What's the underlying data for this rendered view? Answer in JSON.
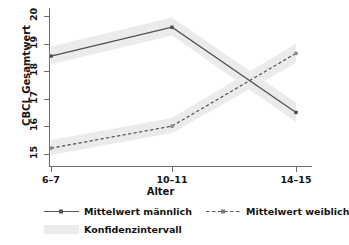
{
  "chart_data": {
    "type": "line",
    "title": "",
    "xlabel": "Alter",
    "ylabel": "CBCL Gesamtwert",
    "categories": [
      "6–7",
      "10–11",
      "14–15"
    ],
    "x_tick_labels": [
      "6–7",
      "10–11",
      "14–15"
    ],
    "y_tick_labels": [
      "15",
      "16",
      "17",
      "18",
      "19",
      "20"
    ],
    "ylim": [
      14.55,
      20.3
    ],
    "yticks": [
      15,
      16,
      17,
      18,
      19,
      20
    ],
    "grid": false,
    "legend_position": "bottom",
    "series": [
      {
        "name": "Mittelwert männlich",
        "style": "solid",
        "marker": "square",
        "color": "#4d4d4d",
        "values": [
          18.55,
          19.6,
          16.5
        ],
        "ci_lower": [
          18.25,
          19.3,
          16.15
        ],
        "ci_upper": [
          18.9,
          19.95,
          16.85
        ]
      },
      {
        "name": "Mittelwert weiblich",
        "style": "dashed",
        "marker": "square",
        "color": "#4d4d4d",
        "values": [
          15.2,
          16.0,
          18.65
        ],
        "ci_lower": [
          14.95,
          15.75,
          18.3
        ],
        "ci_upper": [
          15.5,
          16.3,
          19.0
        ]
      }
    ],
    "confidence_band_color": "#eceaea"
  },
  "axes": {
    "y_title": "CBCL Gesamtwert",
    "x_title": "Alter",
    "y_ticks": [
      {
        "label": "20",
        "value": 20
      },
      {
        "label": "19",
        "value": 19
      },
      {
        "label": "18",
        "value": 18
      },
      {
        "label": "17",
        "value": 17
      },
      {
        "label": "16",
        "value": 16
      },
      {
        "label": "15",
        "value": 15
      }
    ],
    "x_ticks": [
      {
        "label": "6–7"
      },
      {
        "label": "10–11"
      },
      {
        "label": "14–15"
      }
    ]
  },
  "legend": {
    "items": [
      {
        "label": "Mittelwert männlich",
        "style": "solid"
      },
      {
        "label": "Mittelwert weiblich",
        "style": "dashed"
      },
      {
        "label": "Konfidenzintervall",
        "style": "band"
      }
    ]
  }
}
